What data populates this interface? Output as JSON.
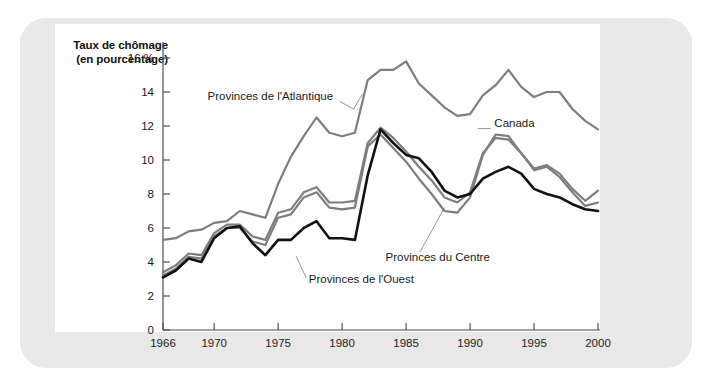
{
  "figure": {
    "background_color": "#e8e8e8",
    "panel_color": "#ffffff",
    "title_line1": "Taux de chômage",
    "title_line2": "(en pourcentage)"
  },
  "chart_data": {
    "type": "line",
    "title": "Taux de chômage (en pourcentage)",
    "xlabel": "",
    "ylabel": "Taux de chômage (en pourcentage)",
    "xlim": [
      1966,
      2000
    ],
    "ylim": [
      0,
      16
    ],
    "grid": false,
    "legend_position": "inline-annotations",
    "x_tick_labels": [
      "1966",
      "1970",
      "1975",
      "1980",
      "1985",
      "1990",
      "1995",
      "2000"
    ],
    "x_ticks": [
      1966,
      1970,
      1975,
      1980,
      1985,
      1990,
      1995,
      2000
    ],
    "y_tick_labels": [
      "0",
      "2",
      "4",
      "6",
      "8",
      "10",
      "12",
      "14",
      "16 %"
    ],
    "y_ticks": [
      0,
      2,
      4,
      6,
      8,
      10,
      12,
      14,
      16
    ],
    "x": [
      1966,
      1967,
      1968,
      1969,
      1970,
      1971,
      1972,
      1973,
      1974,
      1975,
      1976,
      1977,
      1978,
      1979,
      1980,
      1981,
      1982,
      1983,
      1984,
      1985,
      1986,
      1987,
      1988,
      1989,
      1990,
      1991,
      1992,
      1993,
      1994,
      1995,
      1996,
      1997,
      1998,
      1999,
      2000
    ],
    "series": [
      {
        "name": "Provinces de l'Atlantique",
        "color": "#7d7d7d",
        "label_x": 1975.2,
        "label_y": 13.6,
        "values": [
          5.3,
          5.4,
          5.8,
          5.9,
          6.3,
          6.4,
          7.0,
          6.8,
          6.6,
          8.6,
          10.2,
          11.4,
          12.5,
          11.6,
          11.4,
          11.6,
          14.7,
          15.3,
          15.3,
          15.8,
          14.5,
          13.8,
          13.1,
          12.6,
          12.7,
          13.8,
          14.4,
          15.3,
          14.3,
          13.7,
          14.0,
          14.0,
          13.0,
          12.3,
          11.8
        ]
      },
      {
        "name": "Canada",
        "color": "#7d7d7d",
        "label_x": 1991.6,
        "label_y": 11.8,
        "values": [
          3.4,
          3.8,
          4.5,
          4.4,
          5.7,
          6.2,
          6.2,
          5.5,
          5.3,
          6.9,
          7.1,
          8.1,
          8.4,
          7.5,
          7.5,
          7.6,
          11.0,
          11.9,
          11.3,
          10.5,
          9.6,
          8.8,
          7.8,
          7.5,
          8.1,
          10.4,
          11.3,
          11.2,
          10.4,
          9.5,
          9.7,
          9.2,
          8.3,
          7.6,
          8.2
        ]
      },
      {
        "name": "Provinces du Centre",
        "color": "#7d7d7d",
        "label_x": 1983.0,
        "label_y": 4.1,
        "values": [
          3.2,
          3.6,
          4.3,
          4.2,
          5.5,
          6.0,
          6.0,
          5.2,
          5.0,
          6.6,
          6.8,
          7.8,
          8.1,
          7.2,
          7.1,
          7.2,
          10.8,
          11.5,
          10.7,
          9.9,
          8.9,
          8.0,
          7.0,
          6.9,
          7.8,
          10.3,
          11.5,
          11.4,
          10.4,
          9.4,
          9.6,
          9.0,
          8.1,
          7.3,
          7.5
        ]
      },
      {
        "name": "Provinces de l'Ouest",
        "color": "#111111",
        "label_x": 1977.0,
        "label_y": 2.8,
        "values": [
          3.1,
          3.5,
          4.2,
          4.0,
          5.4,
          6.0,
          6.1,
          5.1,
          4.4,
          5.3,
          5.3,
          6.0,
          6.4,
          5.4,
          5.4,
          5.3,
          9.1,
          11.8,
          11.0,
          10.3,
          10.1,
          9.3,
          8.2,
          7.8,
          8.0,
          8.9,
          9.3,
          9.6,
          9.2,
          8.3,
          8.0,
          7.8,
          7.4,
          7.1,
          7.0
        ]
      }
    ]
  }
}
